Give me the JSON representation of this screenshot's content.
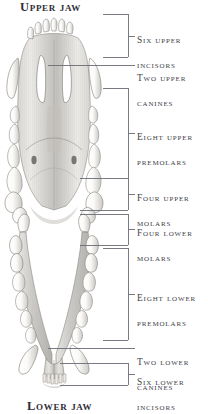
{
  "figure": {
    "kind": "anatomical-plate",
    "titles": {
      "upper": "Upper jaw",
      "lower": "Lower jaw"
    },
    "ink_color": "#3a3a42",
    "line_color": "#6b6b74",
    "paper_color": "#ffffff"
  },
  "callouts": [
    {
      "id": "six-upper-incisors",
      "line1": "Six upper",
      "line2": "incisors",
      "bracket": true,
      "top": 14,
      "bottom": 57,
      "tick_y": 36,
      "text_top": 21
    },
    {
      "id": "two-upper-canines",
      "line1": "Two upper",
      "line2": "canines",
      "bracket": false,
      "top": 65,
      "bottom": 65,
      "tick_y": 65,
      "text_top": 59
    },
    {
      "id": "eight-upper-premolars",
      "line1": "Eight upper",
      "line2": "premolars",
      "bracket": true,
      "top": 88,
      "bottom": 178,
      "tick_y": 133,
      "text_top": 118
    },
    {
      "id": "four-upper-molars",
      "line1": "Four upper",
      "line2": "molars",
      "bracket": true,
      "top": 178,
      "bottom": 210,
      "tick_y": 194,
      "text_top": 179
    },
    {
      "id": "four-lower-molars",
      "line1": "Four lower",
      "line2": "molars",
      "bracket": true,
      "top": 214,
      "bottom": 245,
      "tick_y": 229,
      "text_top": 214
    },
    {
      "id": "eight-lower-premolars",
      "line1": "Eight lower",
      "line2": "premolars",
      "bracket": true,
      "top": 248,
      "bottom": 340,
      "tick_y": 294,
      "text_top": 279
    },
    {
      "id": "two-lower-canines",
      "line1": "Two lower",
      "line2": "canines",
      "bracket": false,
      "top": 348,
      "bottom": 348,
      "tick_y": 348,
      "text_top": 343
    },
    {
      "id": "six-lower-incisors",
      "line1": "Six lower",
      "line2": "incisors",
      "bracket": true,
      "top": 363,
      "bottom": 385,
      "tick_y": 374,
      "text_top": 363
    }
  ],
  "geometry": {
    "bracket_left_x": 103,
    "bracket_right_x": 128,
    "tick_end_x": 135,
    "label_left_x": 137,
    "leader_flat_left_x": 48
  }
}
